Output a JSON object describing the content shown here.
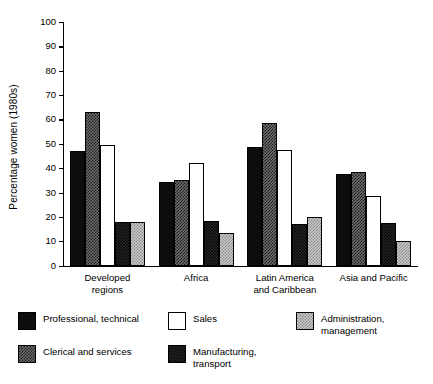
{
  "chart_data": {
    "type": "bar",
    "title": "",
    "xlabel": "",
    "ylabel": "Percentage women (1980s)",
    "ylim": [
      0,
      100
    ],
    "yticks": [
      0,
      10,
      20,
      30,
      40,
      50,
      60,
      70,
      80,
      90,
      100
    ],
    "ytick_labels": [
      "0",
      "10",
      "20",
      "30",
      "40",
      "50",
      "60",
      "70",
      "80",
      "90",
      "100"
    ],
    "grid": false,
    "legend_position": "below-plot",
    "categories": [
      "Developed regions",
      "Africa",
      "Latin America and Caribbean",
      "Asia and Pacific"
    ],
    "category_lines": [
      [
        "Developed",
        "regions"
      ],
      [
        "Africa",
        ""
      ],
      [
        "Latin America",
        "and Caribbean"
      ],
      [
        "Asia and Pacific",
        ""
      ]
    ],
    "series": [
      {
        "name": "Professional, technical",
        "name_lines": [
          "Professional, technical",
          ""
        ],
        "fill": "solid-black",
        "color": "#0d0d0d",
        "values": [
          47,
          34.5,
          48.5,
          37.5
        ]
      },
      {
        "name": "Clerical and services",
        "name_lines": [
          "Clerical and services",
          ""
        ],
        "fill": "medium-checker",
        "color": "#6e6e6e",
        "values": [
          63,
          35,
          58.5,
          38.5
        ]
      },
      {
        "name": "Sales",
        "name_lines": [
          "Sales",
          ""
        ],
        "fill": "white-outline",
        "color": "#ffffff",
        "values": [
          49.5,
          42,
          47.5,
          28.5
        ]
      },
      {
        "name": "Manufacturing, transport",
        "name_lines": [
          "Manufacturing,",
          "transport"
        ],
        "fill": "dark-checker",
        "color": "#262626",
        "values": [
          18,
          18.5,
          17,
          17.5
        ]
      },
      {
        "name": "Administration, management",
        "name_lines": [
          "Administration,",
          "management"
        ],
        "fill": "light-checker",
        "color": "#c9c9c9",
        "values": [
          18,
          13.5,
          20,
          10
        ]
      }
    ]
  }
}
